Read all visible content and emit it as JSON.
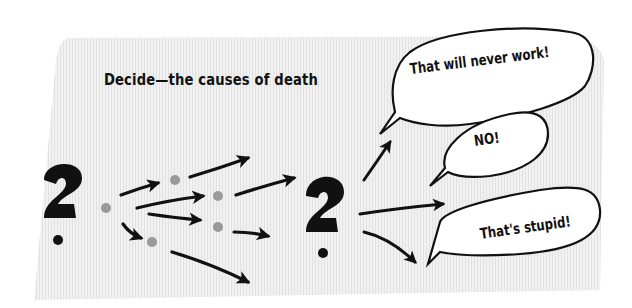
{
  "diagram": {
    "title": "Decide—the causes of death",
    "start_symbol": "question-mark",
    "middle_symbol": "question-mark",
    "node_count": 6,
    "node_color": "#9a9a9a",
    "background_color": "#eeeeee",
    "ink_color": "#111111",
    "reactions": [
      {
        "label": "That will never work!"
      },
      {
        "label": "NO!"
      },
      {
        "label": "That's stupid!"
      }
    ]
  }
}
